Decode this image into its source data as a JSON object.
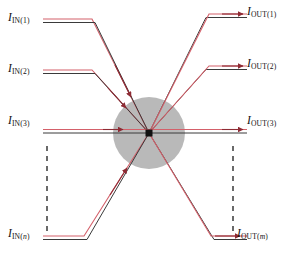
{
  "figure": {
    "background_color": "#ffffff",
    "width": 302,
    "height": 256
  },
  "colors": {
    "signal_red": "#d4606a",
    "signal_black": "#3a3a3a",
    "arrow_red": "#8e2b34",
    "node_fill": "#111111",
    "hub_fill": "#b9b9b9",
    "dash_color": "#1a1a1a"
  },
  "labels": {
    "inputs": [
      {
        "name": "input-1",
        "symbol": "I",
        "sub": "IN(1)",
        "index": "1",
        "index_italic": false
      },
      {
        "name": "input-2",
        "symbol": "I",
        "sub": "IN(2)",
        "index": "2",
        "index_italic": false
      },
      {
        "name": "input-3",
        "symbol": "I",
        "sub": "IN(3)",
        "index": "3",
        "index_italic": false
      },
      {
        "name": "input-n",
        "symbol": "I",
        "sub": "IN(n)",
        "index": "n",
        "index_italic": true
      }
    ],
    "outputs": [
      {
        "name": "output-1",
        "symbol": "I",
        "sub": "OUT(1)",
        "index": "1",
        "index_italic": false
      },
      {
        "name": "output-2",
        "symbol": "I",
        "sub": "OUT(2)",
        "index": "2",
        "index_italic": false
      },
      {
        "name": "output-3",
        "symbol": "I",
        "sub": "OUT(3)",
        "index": "3",
        "index_italic": false
      },
      {
        "name": "output-m",
        "symbol": "I",
        "sub": "OUT(m)",
        "index": "m",
        "index_italic": true
      }
    ],
    "parts": {
      "in1_pre": "I",
      "in1_sub_pre": "IN(",
      "in1_idx": "1",
      "in1_sub_post": ")",
      "in2_pre": "I",
      "in2_sub_pre": "IN(",
      "in2_idx": "2",
      "in2_sub_post": ")",
      "in3_pre": "I",
      "in3_sub_pre": "IN(",
      "in3_idx": "3",
      "in3_sub_post": ")",
      "inn_pre": "I",
      "inn_sub_pre": "IN(",
      "inn_idx": "n",
      "inn_sub_post": ")",
      "out1_pre": "I",
      "out1_sub_pre": "OUT(",
      "out1_idx": "1",
      "out1_sub_post": ")",
      "out2_pre": "I",
      "out2_sub_pre": "OUT(",
      "out2_idx": "2",
      "out2_sub_post": ")",
      "out3_pre": "I",
      "out3_sub_pre": "OUT(",
      "out3_idx": "3",
      "out3_sub_post": ")",
      "outm_pre": "I",
      "outm_sub_pre": "OUT(",
      "outm_idx": "m",
      "outm_sub_post": ")"
    }
  },
  "hub": {
    "name": "central-hub",
    "center_x": 149,
    "center_y": 133,
    "radius": 36,
    "node_size": 7
  },
  "ellipsis": {
    "left_x": 47,
    "right_x": 233,
    "y_start": 146,
    "y_end": 232,
    "meaning": "continuation of additional channels"
  },
  "channels": {
    "input_count_visible": 4,
    "output_count_visible": 4,
    "description": "Each channel is drawn as a parallel red/black trace pair converging on the central node."
  }
}
